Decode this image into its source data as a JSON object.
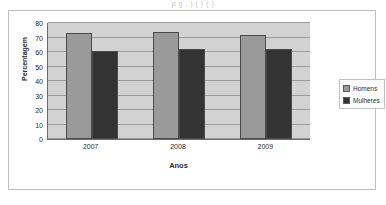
{
  "page_bleed_text": "p g , ) ( ) ( )",
  "chart_data": {
    "type": "bar",
    "title": "",
    "subtitle": "",
    "xlabel": "Anos",
    "ylabel": "Percentagem",
    "categories": [
      "2007",
      "2008",
      "2009"
    ],
    "series": [
      {
        "name": "Homens",
        "values": [
          73,
          74,
          72
        ],
        "color": "#9a9a9a"
      },
      {
        "name": "Mulheres",
        "values": [
          61,
          62,
          62
        ],
        "color": "#333333"
      }
    ],
    "ylim": [
      0,
      80
    ],
    "ytick_values": [
      0,
      10,
      20,
      30,
      40,
      50,
      60,
      70,
      80
    ],
    "ytick_labels": [
      "0",
      "10",
      "20",
      "30",
      "40",
      "50",
      "60",
      "70",
      "80"
    ],
    "grid": true,
    "grid_axis": "y",
    "legend_position": "right",
    "plot_background": "#d2d2d2",
    "gridline_color": "#9b9b9b",
    "axis_color": "#6b6b6b",
    "frame_color": "#bdbdbd"
  },
  "legend": {
    "entries": [
      {
        "label": "Homens",
        "swatch_color": "#9a9a9a"
      },
      {
        "label": "Mulheres",
        "swatch_color": "#333333"
      }
    ]
  }
}
